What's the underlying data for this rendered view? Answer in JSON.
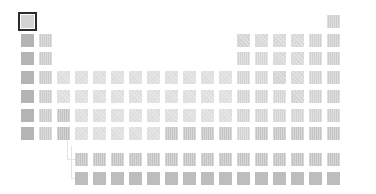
{
  "app": {
    "title": "Periodic Table"
  },
  "colors": {
    "alkali": "#b4b4b4",
    "alkaline": "#cacaca",
    "transition": "#dedede",
    "transition_dark": "#c4c4c4",
    "metalloid": "#d4d4d4",
    "nonmetal": "#d8d8d8",
    "halogen": "#d0d0d0",
    "noble": "#cdcdcd",
    "lanthanide": "#c2c2c2",
    "actinide": "#bdbdbd",
    "post_transition": "#d2d2d2",
    "hydrogen": "#d3d3d3",
    "selected_border": "#2b2b2b"
  },
  "selection": {
    "symbol": "H",
    "index": 0
  },
  "elements": [
    {
      "s": "H",
      "col": 1,
      "row": 1,
      "c": "hydrogen",
      "t": ""
    },
    {
      "s": "He",
      "col": 18,
      "row": 1,
      "c": "noble",
      "t": "v"
    },
    {
      "s": "Li",
      "col": 1,
      "row": 2,
      "c": "alkali",
      "t": ""
    },
    {
      "s": "Be",
      "col": 2,
      "row": 2,
      "c": "alkaline",
      "t": "v"
    },
    {
      "s": "B",
      "col": 13,
      "row": 2,
      "c": "metalloid",
      "t": "d"
    },
    {
      "s": "C",
      "col": 14,
      "row": 2,
      "c": "nonmetal",
      "t": "d"
    },
    {
      "s": "N",
      "col": 15,
      "row": 2,
      "c": "nonmetal",
      "t": "d"
    },
    {
      "s": "O",
      "col": 16,
      "row": 2,
      "c": "nonmetal",
      "t": "d"
    },
    {
      "s": "F",
      "col": 17,
      "row": 2,
      "c": "halogen",
      "t": "v"
    },
    {
      "s": "Ne",
      "col": 18,
      "row": 2,
      "c": "noble",
      "t": "v"
    },
    {
      "s": "Na",
      "col": 1,
      "row": 3,
      "c": "alkali",
      "t": ""
    },
    {
      "s": "Mg",
      "col": 2,
      "row": 3,
      "c": "alkaline",
      "t": "v"
    },
    {
      "s": "Al",
      "col": 13,
      "row": 3,
      "c": "post_transition",
      "t": "v"
    },
    {
      "s": "Si",
      "col": 14,
      "row": 3,
      "c": "metalloid",
      "t": "v"
    },
    {
      "s": "P",
      "col": 15,
      "row": 3,
      "c": "nonmetal",
      "t": "d"
    },
    {
      "s": "S",
      "col": 16,
      "row": 3,
      "c": "nonmetal",
      "t": "d"
    },
    {
      "s": "Cl",
      "col": 17,
      "row": 3,
      "c": "halogen",
      "t": "v"
    },
    {
      "s": "Ar",
      "col": 18,
      "row": 3,
      "c": "noble",
      "t": "v"
    },
    {
      "s": "K",
      "col": 1,
      "row": 4,
      "c": "alkali",
      "t": ""
    },
    {
      "s": "Ca",
      "col": 2,
      "row": 4,
      "c": "alkaline",
      "t": "v"
    },
    {
      "s": "Sc",
      "col": 3,
      "row": 4,
      "c": "transition",
      "t": "d"
    },
    {
      "s": "Ti",
      "col": 4,
      "row": 4,
      "c": "transition",
      "t": "d"
    },
    {
      "s": "V",
      "col": 5,
      "row": 4,
      "c": "transition",
      "t": "d"
    },
    {
      "s": "Cr",
      "col": 6,
      "row": 4,
      "c": "transition",
      "t": "d"
    },
    {
      "s": "Mn",
      "col": 7,
      "row": 4,
      "c": "transition",
      "t": "d"
    },
    {
      "s": "Fe",
      "col": 8,
      "row": 4,
      "c": "transition",
      "t": "d"
    },
    {
      "s": "Co",
      "col": 9,
      "row": 4,
      "c": "transition",
      "t": "d"
    },
    {
      "s": "Ni",
      "col": 10,
      "row": 4,
      "c": "transition",
      "t": "d"
    },
    {
      "s": "Cu",
      "col": 11,
      "row": 4,
      "c": "transition",
      "t": "d"
    },
    {
      "s": "Zn",
      "col": 12,
      "row": 4,
      "c": "transition",
      "t": "d"
    },
    {
      "s": "Ga",
      "col": 13,
      "row": 4,
      "c": "post_transition",
      "t": "v"
    },
    {
      "s": "Ge",
      "col": 14,
      "row": 4,
      "c": "metalloid",
      "t": "v"
    },
    {
      "s": "As",
      "col": 15,
      "row": 4,
      "c": "metalloid",
      "t": "d"
    },
    {
      "s": "Se",
      "col": 16,
      "row": 4,
      "c": "nonmetal",
      "t": "d"
    },
    {
      "s": "Br",
      "col": 17,
      "row": 4,
      "c": "halogen",
      "t": "v"
    },
    {
      "s": "Kr",
      "col": 18,
      "row": 4,
      "c": "noble",
      "t": "v"
    },
    {
      "s": "Rb",
      "col": 1,
      "row": 5,
      "c": "alkali",
      "t": ""
    },
    {
      "s": "Sr",
      "col": 2,
      "row": 5,
      "c": "alkaline",
      "t": "v"
    },
    {
      "s": "Y",
      "col": 3,
      "row": 5,
      "c": "transition",
      "t": "d"
    },
    {
      "s": "Zr",
      "col": 4,
      "row": 5,
      "c": "transition",
      "t": "d"
    },
    {
      "s": "Nb",
      "col": 5,
      "row": 5,
      "c": "transition",
      "t": "d"
    },
    {
      "s": "Mo",
      "col": 6,
      "row": 5,
      "c": "transition",
      "t": "d"
    },
    {
      "s": "Tc",
      "col": 7,
      "row": 5,
      "c": "transition",
      "t": "d"
    },
    {
      "s": "Ru",
      "col": 8,
      "row": 5,
      "c": "transition",
      "t": "d"
    },
    {
      "s": "Rh",
      "col": 9,
      "row": 5,
      "c": "transition",
      "t": "d"
    },
    {
      "s": "Pd",
      "col": 10,
      "row": 5,
      "c": "transition",
      "t": "d"
    },
    {
      "s": "Ag",
      "col": 11,
      "row": 5,
      "c": "transition",
      "t": "d"
    },
    {
      "s": "Cd",
      "col": 12,
      "row": 5,
      "c": "transition",
      "t": "d"
    },
    {
      "s": "In",
      "col": 13,
      "row": 5,
      "c": "post_transition",
      "t": "v"
    },
    {
      "s": "Sn",
      "col": 14,
      "row": 5,
      "c": "post_transition",
      "t": "v"
    },
    {
      "s": "Sb",
      "col": 15,
      "row": 5,
      "c": "metalloid",
      "t": "v"
    },
    {
      "s": "Te",
      "col": 16,
      "row": 5,
      "c": "metalloid",
      "t": "d"
    },
    {
      "s": "I",
      "col": 17,
      "row": 5,
      "c": "halogen",
      "t": "v"
    },
    {
      "s": "Xe",
      "col": 18,
      "row": 5,
      "c": "noble",
      "t": "v"
    },
    {
      "s": "Cs",
      "col": 1,
      "row": 6,
      "c": "alkali",
      "t": ""
    },
    {
      "s": "Ba",
      "col": 2,
      "row": 6,
      "c": "alkaline",
      "t": "v"
    },
    {
      "s": "La-Lu",
      "col": 3,
      "row": 6,
      "c": "lanthanide",
      "t": "v"
    },
    {
      "s": "Hf",
      "col": 4,
      "row": 6,
      "c": "transition",
      "t": "d"
    },
    {
      "s": "Ta",
      "col": 5,
      "row": 6,
      "c": "transition",
      "t": "d"
    },
    {
      "s": "W",
      "col": 6,
      "row": 6,
      "c": "transition",
      "t": "d"
    },
    {
      "s": "Re",
      "col": 7,
      "row": 6,
      "c": "transition",
      "t": "d"
    },
    {
      "s": "Os",
      "col": 8,
      "row": 6,
      "c": "transition",
      "t": "d"
    },
    {
      "s": "Ir",
      "col": 9,
      "row": 6,
      "c": "transition",
      "t": "d"
    },
    {
      "s": "Pt",
      "col": 10,
      "row": 6,
      "c": "transition",
      "t": "d"
    },
    {
      "s": "Au",
      "col": 11,
      "row": 6,
      "c": "transition",
      "t": "d"
    },
    {
      "s": "Hg",
      "col": 12,
      "row": 6,
      "c": "transition",
      "t": "d"
    },
    {
      "s": "Tl",
      "col": 13,
      "row": 6,
      "c": "post_transition",
      "t": "v"
    },
    {
      "s": "Pb",
      "col": 14,
      "row": 6,
      "c": "post_transition",
      "t": "v"
    },
    {
      "s": "Bi",
      "col": 15,
      "row": 6,
      "c": "post_transition",
      "t": "v"
    },
    {
      "s": "Po",
      "col": 16,
      "row": 6,
      "c": "post_transition",
      "t": "v"
    },
    {
      "s": "At",
      "col": 17,
      "row": 6,
      "c": "halogen",
      "t": "v"
    },
    {
      "s": "Rn",
      "col": 18,
      "row": 6,
      "c": "noble",
      "t": "v"
    },
    {
      "s": "Fr",
      "col": 1,
      "row": 7,
      "c": "alkali",
      "t": ""
    },
    {
      "s": "Ra",
      "col": 2,
      "row": 7,
      "c": "alkaline",
      "t": "v"
    },
    {
      "s": "Ac-Lr",
      "col": 3,
      "row": 7,
      "c": "actinide",
      "t": "v"
    },
    {
      "s": "Rf",
      "col": 4,
      "row": 7,
      "c": "transition",
      "t": "d"
    },
    {
      "s": "Db",
      "col": 5,
      "row": 7,
      "c": "transition",
      "t": "d"
    },
    {
      "s": "Sg",
      "col": 6,
      "row": 7,
      "c": "transition",
      "t": "d"
    },
    {
      "s": "Bh",
      "col": 7,
      "row": 7,
      "c": "transition",
      "t": "d"
    },
    {
      "s": "Hs",
      "col": 8,
      "row": 7,
      "c": "transition",
      "t": "d"
    },
    {
      "s": "Mt",
      "col": 9,
      "row": 7,
      "c": "transition_dark",
      "t": "v"
    },
    {
      "s": "Ds",
      "col": 10,
      "row": 7,
      "c": "transition_dark",
      "t": "v"
    },
    {
      "s": "Rg",
      "col": 11,
      "row": 7,
      "c": "transition_dark",
      "t": "v"
    },
    {
      "s": "Cn",
      "col": 12,
      "row": 7,
      "c": "transition_dark",
      "t": "v"
    },
    {
      "s": "Nh",
      "col": 13,
      "row": 7,
      "c": "post_transition",
      "t": "v"
    },
    {
      "s": "Fl",
      "col": 14,
      "row": 7,
      "c": "transition_dark",
      "t": "v"
    },
    {
      "s": "Mc",
      "col": 15,
      "row": 7,
      "c": "transition_dark",
      "t": "v"
    },
    {
      "s": "Lv",
      "col": 16,
      "row": 7,
      "c": "transition_dark",
      "t": "v"
    },
    {
      "s": "Ts",
      "col": 17,
      "row": 7,
      "c": "transition_dark",
      "t": "v"
    },
    {
      "s": "Og",
      "col": 18,
      "row": 7,
      "c": "transition_dark",
      "t": "v"
    }
  ],
  "f_block": [
    {
      "s": "La",
      "col": 4,
      "row": 9,
      "c": "lanthanide",
      "t": "v"
    },
    {
      "s": "Ce",
      "col": 5,
      "row": 9,
      "c": "lanthanide",
      "t": "v"
    },
    {
      "s": "Pr",
      "col": 6,
      "row": 9,
      "c": "lanthanide",
      "t": "v"
    },
    {
      "s": "Nd",
      "col": 7,
      "row": 9,
      "c": "lanthanide",
      "t": "v"
    },
    {
      "s": "Pm",
      "col": 8,
      "row": 9,
      "c": "lanthanide",
      "t": "v"
    },
    {
      "s": "Sm",
      "col": 9,
      "row": 9,
      "c": "lanthanide",
      "t": "v"
    },
    {
      "s": "Eu",
      "col": 10,
      "row": 9,
      "c": "lanthanide",
      "t": "v"
    },
    {
      "s": "Gd",
      "col": 11,
      "row": 9,
      "c": "lanthanide",
      "t": "v"
    },
    {
      "s": "Tb",
      "col": 12,
      "row": 9,
      "c": "lanthanide",
      "t": "v"
    },
    {
      "s": "Dy",
      "col": 13,
      "row": 9,
      "c": "lanthanide",
      "t": "v"
    },
    {
      "s": "Ho",
      "col": 14,
      "row": 9,
      "c": "lanthanide",
      "t": "v"
    },
    {
      "s": "Er",
      "col": 15,
      "row": 9,
      "c": "lanthanide",
      "t": "v"
    },
    {
      "s": "Tm",
      "col": 16,
      "row": 9,
      "c": "lanthanide",
      "t": "v"
    },
    {
      "s": "Yb",
      "col": 17,
      "row": 9,
      "c": "lanthanide",
      "t": "v"
    },
    {
      "s": "Lu",
      "col": 18,
      "row": 9,
      "c": "lanthanide",
      "t": "v"
    },
    {
      "s": "Ac",
      "col": 4,
      "row": 10,
      "c": "actinide",
      "t": ""
    },
    {
      "s": "Th",
      "col": 5,
      "row": 10,
      "c": "actinide",
      "t": ""
    },
    {
      "s": "Pa",
      "col": 6,
      "row": 10,
      "c": "actinide",
      "t": ""
    },
    {
      "s": "U",
      "col": 7,
      "row": 10,
      "c": "actinide",
      "t": ""
    },
    {
      "s": "Np",
      "col": 8,
      "row": 10,
      "c": "actinide",
      "t": ""
    },
    {
      "s": "Pu",
      "col": 9,
      "row": 10,
      "c": "actinide",
      "t": ""
    },
    {
      "s": "Am",
      "col": 10,
      "row": 10,
      "c": "actinide",
      "t": ""
    },
    {
      "s": "Cm",
      "col": 11,
      "row": 10,
      "c": "actinide",
      "t": ""
    },
    {
      "s": "Bk",
      "col": 12,
      "row": 10,
      "c": "actinide",
      "t": ""
    },
    {
      "s": "Cf",
      "col": 13,
      "row": 10,
      "c": "actinide",
      "t": ""
    },
    {
      "s": "Es",
      "col": 14,
      "row": 10,
      "c": "actinide",
      "t": ""
    },
    {
      "s": "Fm",
      "col": 15,
      "row": 10,
      "c": "actinide",
      "t": ""
    },
    {
      "s": "Md",
      "col": 16,
      "row": 10,
      "c": "actinide",
      "t": ""
    },
    {
      "s": "No",
      "col": 17,
      "row": 10,
      "c": "actinide",
      "t": ""
    },
    {
      "s": "Lr",
      "col": 18,
      "row": 10,
      "c": "actinide",
      "t": ""
    }
  ]
}
